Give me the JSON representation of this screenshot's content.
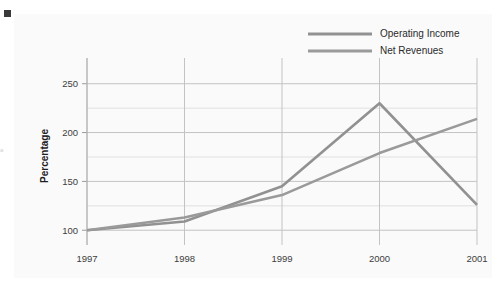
{
  "decorations": {
    "corner_marker_color": "#3a3a3a",
    "margin_note_text": "a"
  },
  "panel": {
    "background_color": "#fafafa"
  },
  "chart_data": {
    "type": "line",
    "title": "",
    "xlabel": "",
    "ylabel": "Percentage",
    "categories": [
      "1997",
      "1998",
      "1999",
      "2000",
      "2001"
    ],
    "series": [
      {
        "name": "Operating Income",
        "color": "#919191",
        "values": [
          100,
          109,
          145,
          230,
          126
        ]
      },
      {
        "name": "Net Revenues",
        "color": "#9a9a9a",
        "values": [
          100,
          113,
          136,
          179,
          214
        ]
      }
    ],
    "ylim": [
      90,
      262
    ],
    "ytick_labels": [
      "100",
      "150",
      "200",
      "250"
    ],
    "ytick_values": [
      100,
      150,
      200,
      250
    ],
    "yminor_values": [
      125,
      175,
      225
    ],
    "grid": true,
    "legend_position": "top-right"
  }
}
